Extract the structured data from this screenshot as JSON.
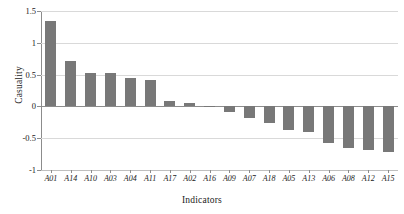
{
  "chart_data": {
    "type": "bar",
    "title": "",
    "xlabel": "Indicators",
    "ylabel": "Casuality",
    "categories": [
      "A01",
      "A14",
      "A10",
      "A03",
      "A04",
      "A11",
      "A17",
      "A02",
      "A16",
      "A09",
      "A07",
      "A18",
      "A05",
      "A13",
      "A06",
      "A08",
      "A12",
      "A15"
    ],
    "values": [
      1.34,
      0.72,
      0.53,
      0.53,
      0.44,
      0.41,
      0.08,
      0.06,
      -0.01,
      -0.09,
      -0.19,
      -0.26,
      -0.37,
      -0.41,
      -0.58,
      -0.65,
      -0.68,
      -0.71
    ],
    "ylim": [
      -1,
      1.5
    ],
    "yticks": [
      1.5,
      1,
      0.5,
      0,
      -0.5,
      -1
    ],
    "ytick_labels": [
      "1.5",
      "1",
      "0.5",
      "0",
      "-0.5",
      "-1"
    ],
    "grid": true,
    "legend": null,
    "bar_color": "#787878",
    "grid_color": "#d9d9d9",
    "axis_color": "#8c8c8c"
  }
}
